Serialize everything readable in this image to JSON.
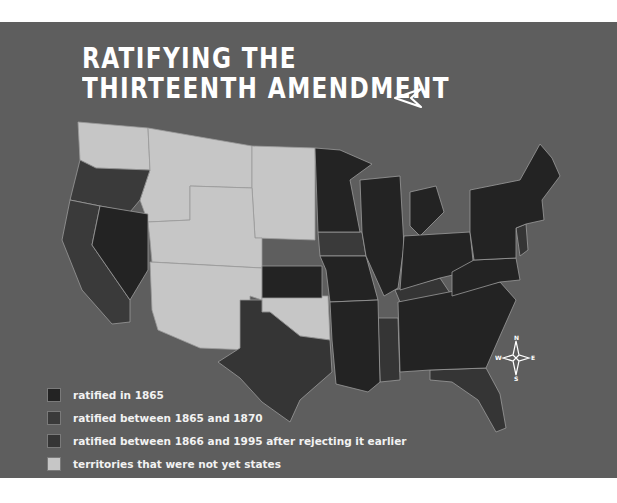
{
  "title": {
    "line1": "RATIFYING THE",
    "line2": "THIRTEENTH AMENDMENT"
  },
  "colors": {
    "background": "#5e5e5e",
    "ratified_1865": "#232323",
    "ratified_1865_1870": "#3a3a3a",
    "ratified_after_rejecting": "#353535",
    "territories": "#c6c6c6",
    "border": "#9a9a9a"
  },
  "legend": {
    "items": [
      {
        "label": "ratified in 1865",
        "color": "#232323"
      },
      {
        "label": "ratified between 1865 and 1870",
        "color": "#3a3a3a"
      },
      {
        "label": "ratified between 1866 and 1995 after rejecting it earlier",
        "color": "#353535"
      },
      {
        "label": "territories that were not yet states",
        "color": "#c6c6c6"
      }
    ]
  },
  "compass": {
    "n": "N",
    "s": "S",
    "e": "E",
    "w": "W"
  },
  "icons": {
    "direction_arrow": "arrow-left-icon",
    "compass": "compass-rose-icon"
  }
}
